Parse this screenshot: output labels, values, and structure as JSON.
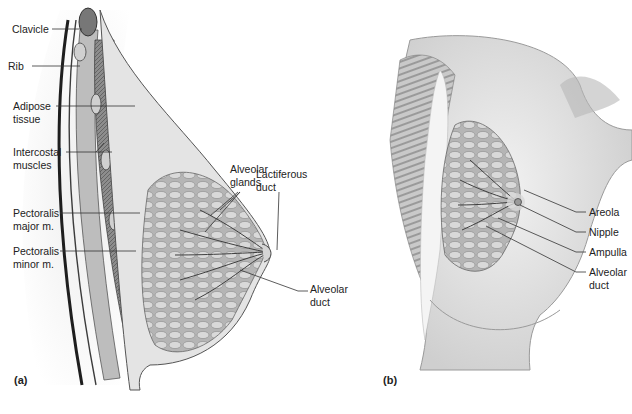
{
  "figure": {
    "panels": [
      {
        "id": "a",
        "label": "(a)",
        "view": "sagittal section",
        "callouts": [
          {
            "text": "Clavicle"
          },
          {
            "text": "Rib"
          },
          {
            "text": "Adipose\ntissue"
          },
          {
            "text": "Intercostal\nmuscles"
          },
          {
            "text": "Pectoralis\nmajor m."
          },
          {
            "text": "Pectoralis\nminor m."
          },
          {
            "text": "Alveolar\nglands"
          },
          {
            "text": "Lactiferous\nduct"
          },
          {
            "text": "Alveolar\nduct"
          }
        ]
      },
      {
        "id": "b",
        "label": "(b)",
        "view": "anterior view",
        "callouts": [
          {
            "text": "Areola"
          },
          {
            "text": "Nipple"
          },
          {
            "text": "Ampulla"
          },
          {
            "text": "Alveolar\nduct"
          }
        ]
      }
    ]
  },
  "colors": {
    "line": "#333333",
    "tissue_dark": "#4a4a4a",
    "tissue_mid": "#9a9a9a",
    "tissue_light": "#d8d8d8",
    "skin": "#e9e9e9",
    "background": "#ffffff"
  }
}
